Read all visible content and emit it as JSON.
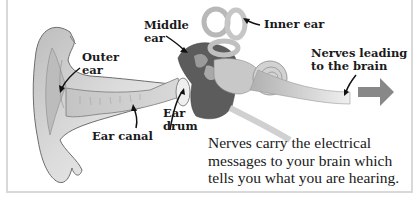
{
  "diagram": {
    "labels": {
      "outer_ear": "Outer\near",
      "middle_ear": "Middle\near",
      "inner_ear": "Inner ear",
      "nerves": "Nerves leading\nto the brain",
      "ear_canal": "Ear canal",
      "ear_drum": "Ear\ndrum"
    },
    "caption": {
      "lines": [
        "Nerves carry the electrical",
        "messages to your brain which",
        "tells you what you are hearing."
      ]
    },
    "colors": {
      "arrow": "#888888",
      "ear_light": "#d6d6d6",
      "ear_mid": "#b5b5b5",
      "ear_dark": "#4a4a4a",
      "outline": "#6e6e6e",
      "border": "#d9d9d9",
      "text": "#1a1a1a"
    }
  }
}
